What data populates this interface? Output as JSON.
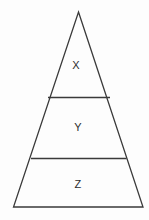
{
  "diagram": {
    "type": "pyramid",
    "title": "",
    "background_color": "#fdfdfd",
    "stroke_color": "#3a3a3a",
    "label_color": "#2e2e2e",
    "stroke_width": 1.3,
    "geometry": {
      "apex": {
        "x": 78.5,
        "y": 12
      },
      "base_left": {
        "x": 13.5,
        "y": 207
      },
      "base_right": {
        "x": 143,
        "y": 207
      },
      "dividers": [
        {
          "y": 97.5,
          "x1": 48,
          "x2": 110
        },
        {
          "y": 158.5,
          "x1": 31,
          "x2": 126.5
        }
      ]
    },
    "tiers": [
      {
        "label": "X",
        "level": 1,
        "position": "top",
        "cx": 76,
        "cy": 66
      },
      {
        "label": "Y",
        "level": 2,
        "position": "middle",
        "cx": 78,
        "cy": 128
      },
      {
        "label": "Z",
        "level": 3,
        "position": "bottom",
        "cx": 78,
        "cy": 185
      }
    ]
  }
}
